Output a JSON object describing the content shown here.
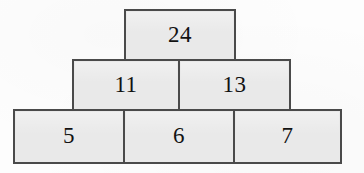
{
  "figure": {
    "kind": "number-pyramid-diagram",
    "rows": [
      {
        "level": "top",
        "bricks": [
          {
            "id": "top",
            "value": "24"
          }
        ]
      },
      {
        "level": "middle",
        "bricks": [
          {
            "id": "mid-left",
            "value": "11"
          },
          {
            "id": "mid-right",
            "value": "13"
          }
        ]
      },
      {
        "level": "bottom",
        "bricks": [
          {
            "id": "bot-left",
            "value": "5"
          },
          {
            "id": "bot-middle",
            "value": "6"
          },
          {
            "id": "bot-right",
            "value": "7"
          }
        ]
      }
    ],
    "colors": {
      "brick_fill": "#e9e9e9",
      "brick_border": "#4a4a4a",
      "text": "#121212",
      "background": "#fdfdfd"
    }
  }
}
